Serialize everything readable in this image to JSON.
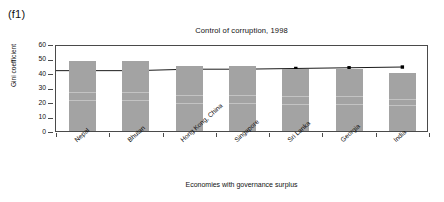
{
  "panel": {
    "label": "(f1)"
  },
  "chart_data": {
    "type": "bar",
    "title": "Control of corruption, 1998",
    "xlabel": "Economies with governance surplus",
    "ylabel": "Gini coefficient",
    "ylim": [
      0,
      60
    ],
    "yticks": [
      0,
      10,
      20,
      30,
      40,
      50,
      60
    ],
    "grid": false,
    "legend": "none",
    "categories": [
      "Nepal",
      "Bhutan",
      "Hong Kong, China",
      "Singapore",
      "Sri Lanka",
      "Georgia",
      "India"
    ],
    "series": [
      {
        "name": "Gini coefficient",
        "type": "bar",
        "color": "#a3a3a3",
        "values": [
          48,
          48,
          45,
          45,
          43,
          43,
          40
        ]
      },
      {
        "name": "Trend line",
        "type": "line",
        "color": "#000000",
        "marker": "square",
        "values": [
          43,
          43,
          44,
          44,
          44.5,
          45,
          45.5
        ]
      }
    ]
  }
}
